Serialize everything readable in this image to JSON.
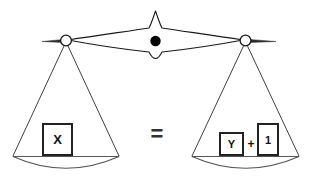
{
  "diagram": {
    "type": "balance-scale",
    "background_color": "#ffffff",
    "line_color": "#1a1a1a",
    "pivot_color": "#000000"
  },
  "operator": {
    "equals_label": "=",
    "plus_label": "+"
  },
  "left_pan": {
    "name": "left-pan",
    "blocks": [
      {
        "label": "X",
        "size": "large"
      }
    ]
  },
  "right_pan": {
    "name": "right-pan",
    "blocks": [
      {
        "label": "Y",
        "size": "small"
      },
      {
        "label": "1",
        "size": "tall"
      }
    ]
  },
  "fulcrum": {
    "name": "fulcrum",
    "pivot_label": ""
  }
}
